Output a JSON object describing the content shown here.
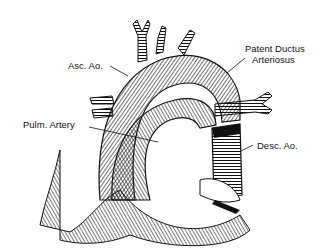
{
  "diagram": {
    "type": "anatomical-illustration",
    "labels": [
      {
        "id": "asc-ao",
        "text": "Asc. Ao."
      },
      {
        "id": "pda-line1",
        "text": "Patent Ductus"
      },
      {
        "id": "pda-line2",
        "text": "Arteriosus"
      },
      {
        "id": "pulm-artery",
        "text": "Pulm. Artery"
      },
      {
        "id": "desc-ao",
        "text": "Desc. Ao."
      }
    ],
    "colors": {
      "ink": "#111111",
      "background": "#ffffff"
    }
  }
}
